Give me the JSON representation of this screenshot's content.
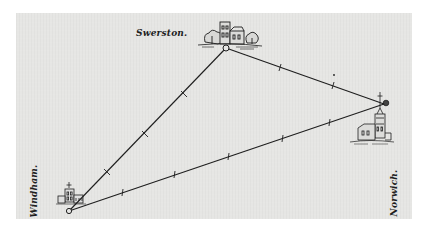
{
  "figure": {
    "type": "triangulation-sketch"
  },
  "places": [
    {
      "id": "swerston",
      "label": "Swerston.",
      "icon": "manor-house-with-trees-icon"
    },
    {
      "id": "windham",
      "label": "Windham.",
      "icon": "church-icon"
    },
    {
      "id": "norwich",
      "label": "Norwich.",
      "icon": "cathedral-spire-icon"
    }
  ],
  "lines": [
    {
      "from": "windham",
      "to": "swerston",
      "ticks": 3
    },
    {
      "from": "swerston",
      "to": "norwich",
      "ticks": 2
    },
    {
      "from": "windham",
      "to": "norwich",
      "ticks": 5
    }
  ],
  "colors": {
    "paper": "#e6e6e4",
    "ink": "#1e1e1e",
    "background": "#ffffff"
  }
}
